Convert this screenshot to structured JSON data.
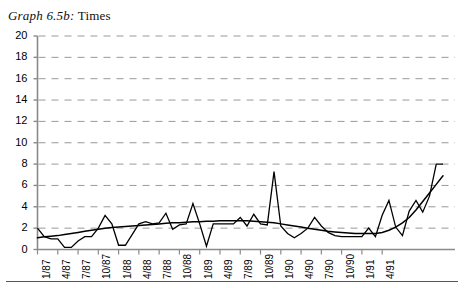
{
  "figure": {
    "caption_label": "Graph 6.5b:",
    "caption_title": "Times",
    "bottom_rule": true
  },
  "chart_data": {
    "type": "line",
    "title": "Graph 6.5b: Times",
    "xlabel": "",
    "ylabel": "",
    "ylim": [
      0,
      20
    ],
    "ytick_step": 2,
    "ytick_labels": [
      "0",
      "2",
      "4",
      "6",
      "8",
      "10",
      "12",
      "14",
      "16",
      "18",
      "20"
    ],
    "grid": "horizontal-dashed",
    "legend": "none",
    "x_tick_labels": [
      "1/87",
      "4/87",
      "7/87",
      "10/87",
      "1/88",
      "4/88",
      "7/88",
      "10/88",
      "1/89",
      "4/89",
      "7/89",
      "10/89",
      "1/90",
      "4/90",
      "7/90",
      "10/90",
      "1/91",
      "4/91"
    ],
    "x_tick_label_rotation": -90,
    "x_points_per_tick": 3,
    "series": [
      {
        "name": "Times",
        "style": "jagged-monthly",
        "values": [
          2.0,
          1.2,
          1.0,
          1.0,
          0.2,
          0.2,
          0.8,
          1.2,
          1.2,
          2.0,
          3.2,
          2.4,
          0.4,
          0.4,
          1.4,
          2.4,
          2.6,
          2.4,
          2.5,
          3.4,
          1.9,
          2.3,
          2.4,
          4.3,
          2.4,
          0.3,
          2.4,
          2.4,
          2.4,
          2.4,
          3.0,
          2.2,
          3.3,
          2.4,
          2.3,
          7.3,
          2.2,
          1.5,
          1.1,
          1.5,
          2.0,
          3.0,
          2.2,
          1.6,
          1.3,
          1.2,
          1.2,
          1.2,
          1.2,
          2.0,
          1.2,
          3.2,
          4.6,
          2.1,
          1.3,
          3.6,
          4.6,
          3.5,
          5.0,
          8.0,
          8.0
        ]
      },
      {
        "name": "Trend",
        "style": "smooth-trend",
        "values": [
          1.1,
          1.2,
          1.25,
          1.3,
          1.4,
          1.5,
          1.6,
          1.7,
          1.8,
          1.9,
          2.0,
          2.05,
          2.1,
          2.15,
          2.2,
          2.25,
          2.3,
          2.35,
          2.4,
          2.45,
          2.5,
          2.5,
          2.55,
          2.6,
          2.6,
          2.65,
          2.65,
          2.7,
          2.7,
          2.7,
          2.7,
          2.7,
          2.65,
          2.6,
          2.55,
          2.5,
          2.4,
          2.3,
          2.2,
          2.1,
          2.0,
          1.9,
          1.8,
          1.7,
          1.65,
          1.6,
          1.55,
          1.5,
          1.5,
          1.5,
          1.5,
          1.6,
          1.8,
          2.1,
          2.5,
          3.0,
          3.7,
          4.5,
          5.3,
          6.1,
          6.9
        ]
      }
    ]
  }
}
